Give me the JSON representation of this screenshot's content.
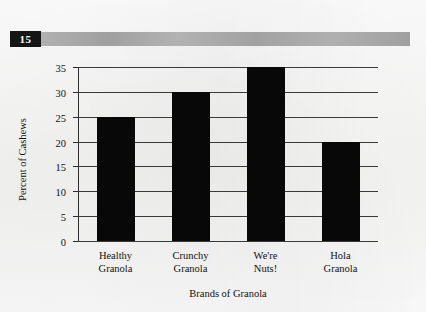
{
  "header": {
    "number": "15",
    "bar_color": "#a8a8a8"
  },
  "chart_data": {
    "type": "bar",
    "title": "",
    "xlabel": "Brands of Granola",
    "ylabel": "Percent of Cashews",
    "categories": [
      "Healthy Granola",
      "Crunchy Granola",
      "We're Nuts!",
      "Hola Granola"
    ],
    "category_lines": [
      [
        "Healthy",
        "Granola"
      ],
      [
        "Crunchy",
        "Granola"
      ],
      [
        "We're",
        "Nuts!"
      ],
      [
        "Hola",
        "Granola"
      ]
    ],
    "values": [
      25,
      30,
      35,
      20
    ],
    "ylim": [
      0,
      35
    ],
    "yticks": [
      0,
      5,
      10,
      15,
      20,
      25,
      30,
      35
    ],
    "ytick_labels": [
      "0",
      "5",
      "10",
      "15",
      "20",
      "25",
      "30",
      "35"
    ],
    "grid": true,
    "legend": "none",
    "bar_color": "#080808"
  }
}
